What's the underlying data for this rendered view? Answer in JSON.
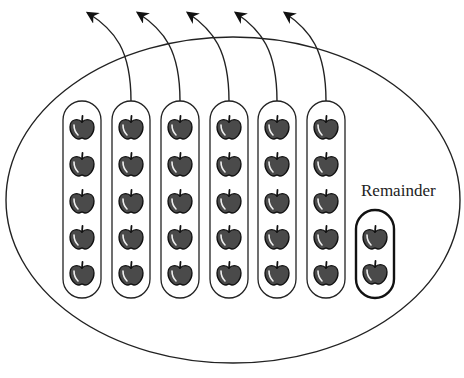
{
  "diagram": {
    "type": "division-with-remainder",
    "labels": {
      "remainder": "Remainder"
    },
    "colors": {
      "stroke": "#222222",
      "apple_fill": "#4a4a4a",
      "apple_highlight": "#e8e8e8",
      "background": "#ffffff"
    },
    "set": {
      "cx": 233,
      "cy": 200,
      "rx": 227,
      "ry": 163
    },
    "groups": [
      {
        "id": 1,
        "x": 63,
        "apples": 5,
        "has_arrow": false
      },
      {
        "id": 2,
        "x": 112,
        "apples": 5,
        "has_arrow": true
      },
      {
        "id": 3,
        "x": 161,
        "apples": 5,
        "has_arrow": true
      },
      {
        "id": 4,
        "x": 210,
        "apples": 5,
        "has_arrow": true
      },
      {
        "id": 5,
        "x": 258,
        "apples": 5,
        "has_arrow": true
      },
      {
        "id": 6,
        "x": 307,
        "apples": 5,
        "has_arrow": true
      }
    ],
    "remainder_group": {
      "x": 356,
      "y": 210,
      "apples": 2
    },
    "counts": {
      "groups": 6,
      "apples_per_group": 5,
      "remainder": 2,
      "total": 32,
      "arrows": 5
    }
  }
}
